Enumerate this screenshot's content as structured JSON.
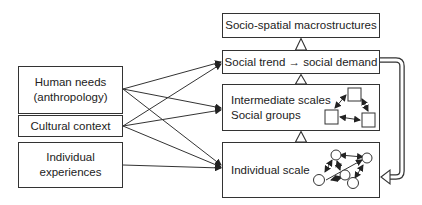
{
  "diagram": {
    "inputs": [
      {
        "id": "human-needs",
        "lines": [
          "Human needs",
          "(anthropology)"
        ]
      },
      {
        "id": "cultural-context",
        "lines": [
          "Cultural context"
        ]
      },
      {
        "id": "individual-experiences",
        "lines": [
          "Individual",
          "experiences"
        ]
      }
    ],
    "levels": [
      {
        "id": "macrostructures",
        "lines": [
          "Socio-spatial macrostructures"
        ]
      },
      {
        "id": "social-trend",
        "lines": [
          "Social trend → social demand"
        ]
      },
      {
        "id": "intermediate",
        "lines": [
          "Intermediate scales",
          "Social groups"
        ]
      },
      {
        "id": "individual-scale",
        "lines": [
          "Individual scale"
        ]
      }
    ],
    "connections": [
      {
        "from": "human-needs",
        "to": "social-trend"
      },
      {
        "from": "human-needs",
        "to": "intermediate"
      },
      {
        "from": "human-needs",
        "to": "individual-scale"
      },
      {
        "from": "cultural-context",
        "to": "social-trend"
      },
      {
        "from": "cultural-context",
        "to": "intermediate"
      },
      {
        "from": "cultural-context",
        "to": "individual-scale"
      },
      {
        "from": "individual-experiences",
        "to": "individual-scale"
      }
    ],
    "hierarchy_arrows": [
      {
        "from": "social-trend",
        "to": "macrostructures"
      },
      {
        "from": "intermediate",
        "to": "social-trend"
      },
      {
        "from": "individual-scale",
        "to": "intermediate"
      }
    ],
    "feedback_arrow": {
      "from": "social-trend",
      "to": "individual-scale"
    }
  }
}
